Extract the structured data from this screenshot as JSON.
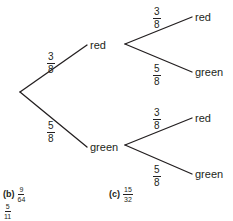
{
  "tree": {
    "level1": {
      "top": {
        "outcome": "red",
        "prob_num": "3",
        "prob_den": "8"
      },
      "bottom": {
        "outcome": "green",
        "prob_num": "5",
        "prob_den": "8"
      }
    },
    "level2_after_red": {
      "top": {
        "outcome": "red",
        "prob_num": "3",
        "prob_den": "8"
      },
      "bottom": {
        "outcome": "green",
        "prob_num": "5",
        "prob_den": "8"
      }
    },
    "level2_after_green": {
      "top": {
        "outcome": "red",
        "prob_num": "3",
        "prob_den": "8"
      },
      "bottom": {
        "outcome": "green",
        "prob_num": "5",
        "prob_den": "8"
      }
    },
    "line_color": "#231f20"
  },
  "answers": {
    "b": {
      "tag": "(b)",
      "num": "9",
      "den": "64"
    },
    "extra": {
      "num": "5",
      "den": "11"
    },
    "c": {
      "tag": "(c)",
      "num": "15",
      "den": "32"
    }
  }
}
